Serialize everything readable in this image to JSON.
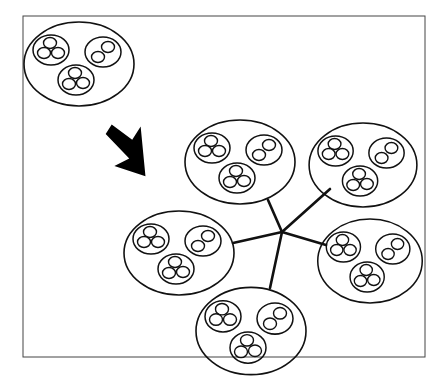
{
  "diagram": {
    "title": "",
    "frame": {
      "x": 23,
      "y": 16,
      "w": 402,
      "h": 341
    },
    "source_cluster": {
      "cx": 79,
      "cy": 64,
      "rx": 55,
      "ry": 42
    },
    "arrow": {
      "direction": "down-right",
      "tip": [
        143,
        190
      ]
    },
    "hub": {
      "x": 282,
      "y": 232
    },
    "network_clusters": [
      {
        "name": "top",
        "cx": 240,
        "cy": 162,
        "rx": 55,
        "ry": 42,
        "spoke_end": [
          268,
          200
        ]
      },
      {
        "name": "top-right",
        "cx": 362,
        "cy": 164,
        "rx": 54,
        "ry": 42,
        "spoke_end": [
          328,
          190
        ]
      },
      {
        "name": "right",
        "cx": 370,
        "cy": 260,
        "rx": 52,
        "ry": 42,
        "spoke_end": [
          326,
          245
        ]
      },
      {
        "name": "bottom",
        "cx": 251,
        "cy": 330,
        "rx": 55,
        "ry": 44,
        "spoke_end": [
          270,
          287
        ]
      },
      {
        "name": "left",
        "cx": 179,
        "cy": 252,
        "rx": 55,
        "ry": 42,
        "spoke_end": [
          234,
          242
        ]
      }
    ],
    "cluster_contents": "Each large ellipse contains three medium circles: two with three small circles, one with two small circles"
  }
}
